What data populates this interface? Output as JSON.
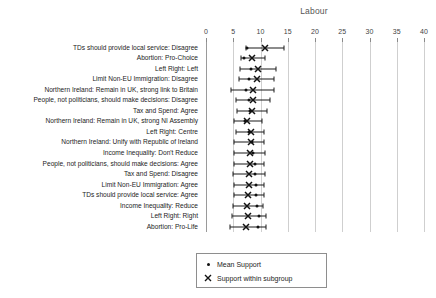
{
  "chart_data": {
    "type": "scatter",
    "title": "Labour",
    "xlabel": "",
    "ylabel": "",
    "xlim": [
      0,
      40
    ],
    "xticks": [
      0,
      5,
      10,
      15,
      20,
      25,
      30,
      35,
      40
    ],
    "grid": true,
    "legend_position": "bottom-center",
    "legend": [
      {
        "label": "Mean Support",
        "marker": "dot"
      },
      {
        "label": "Support within subgroup",
        "marker": "x"
      }
    ],
    "categories": [
      "TDs should provide local service: Disagree",
      "Abortion: Pro-Choice",
      "Left Right: Left",
      "Limit Non-EU Immigration: Disagree",
      "Northern Ireland: Remain in UK, strong link to Britain",
      "People, not politicians, should make decisions: Disagree",
      "Tax and Spend: Agree",
      "Northern Ireland: Remain in UK, strong NI Assembly",
      "Left Right: Centre",
      "Northern Ireland: Unify with Republic of Ireland",
      "Income Inequality: Don't Reduce",
      "People, not politicians, should make decisions: Agree",
      "Tax and Spend: Disagree",
      "Limit Non-EU Immigration: Agree",
      "TDs should provide local service: Agree",
      "Income Inequality: Reduce",
      "Left Right: Right",
      "Abortion: Pro-Life"
    ],
    "series": [
      {
        "name": "Mean Support",
        "marker": "dot",
        "values": [
          7.6,
          7.0,
          8.2,
          7.9,
          7.4,
          7.8,
          8.1,
          7.2,
          7.8,
          8.4,
          8.6,
          8.9,
          9.0,
          9.2,
          9.1,
          9.3,
          9.7,
          9.6
        ]
      },
      {
        "name": "Support within subgroup",
        "marker": "x",
        "values": [
          10.9,
          8.4,
          9.6,
          9.3,
          8.6,
          8.6,
          8.4,
          7.5,
          8.2,
          8.2,
          8.0,
          8.0,
          7.9,
          7.8,
          7.7,
          7.6,
          7.7,
          7.4
        ],
        "ci_low": [
          7.3,
          6.4,
          6.3,
          6.0,
          4.6,
          5.5,
          5.7,
          5.1,
          5.5,
          5.2,
          5.1,
          5.2,
          5.0,
          5.1,
          5.2,
          4.9,
          4.7,
          4.4
        ],
        "ci_high": [
          14.4,
          10.8,
          12.8,
          12.4,
          12.4,
          11.8,
          11.2,
          10.2,
          10.6,
          10.6,
          10.8,
          10.7,
          10.9,
          10.6,
          10.6,
          10.5,
          11.0,
          11.0
        ]
      }
    ]
  }
}
